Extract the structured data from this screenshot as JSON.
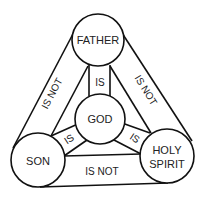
{
  "nodes": {
    "father": {
      "label": "FATHER"
    },
    "god": {
      "label": "GOD"
    },
    "son": {
      "label": "SON"
    },
    "holy_spirit": {
      "label_line1": "HOLY",
      "label_line2": "SPIRIT"
    }
  },
  "edges": {
    "father_son": {
      "label": "IS NOT"
    },
    "father_spirit": {
      "label": "IS NOT"
    },
    "son_spirit": {
      "label": "IS NOT"
    },
    "father_god": {
      "label": "IS"
    },
    "son_god": {
      "label": "IS"
    },
    "spirit_god": {
      "label": "IS"
    }
  },
  "colors": {
    "stroke": "#111111",
    "text": "#222222",
    "background": "#ffffff"
  }
}
